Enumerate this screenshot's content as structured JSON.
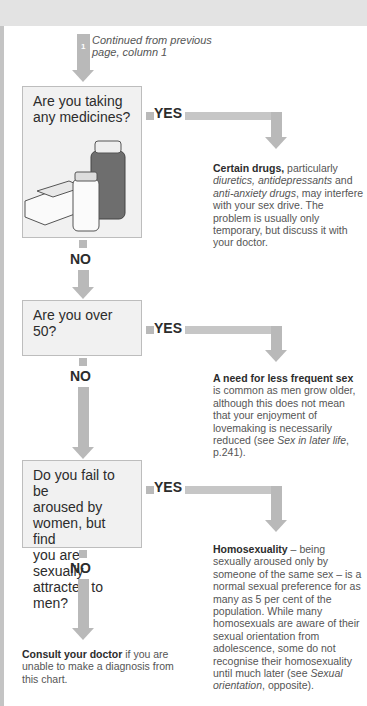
{
  "page": {
    "continued": {
      "badge": "1",
      "text_line1": "Continued from previous",
      "text_line2": "page, column 1"
    },
    "questions": [
      {
        "lines": [
          "Are you taking",
          "any medicines?"
        ],
        "yes_label": "YES",
        "no_label": "NO",
        "answer": {
          "bold": "Certain drugs,",
          "parts": [
            " particularly ",
            "diuretics, antidepressants",
            " and ",
            "anti-anxiety drugs",
            ", may interfere with your sex drive. The problem is usually only temporary, but discuss it with your doctor."
          ]
        },
        "illustration": "medicine-bottles-and-pill-blister-pack"
      },
      {
        "lines": [
          "Are you over 50?"
        ],
        "yes_label": "YES",
        "no_label": "NO",
        "answer": {
          "bold": "A need for less frequent sex",
          "parts": [
            " is common as men grow older, although this does not mean that your enjoyment of lovemaking is necessarily reduced (see ",
            "Sex in later life",
            ", p.241)."
          ]
        }
      },
      {
        "lines": [
          "Do you fail to be",
          "aroused by",
          "women, but find",
          "you are sexually",
          "attracted to men?"
        ],
        "yes_label": "YES",
        "no_label": "NO",
        "answer": {
          "bold": "Homosexuality",
          "parts": [
            " – being sexually aroused only by someone of the same sex – is a normal sexual preference for as many as 5 per cent of the population. While many homosexuals are aware of their sexual orientation from adolescence, some do not recognise their homosexuality until much later (see ",
            "Sexual orientation",
            ", opposite)."
          ]
        }
      }
    ],
    "final": {
      "bold": "Consult your doctor",
      "rest": " if you are unable to make a diagnosis from this chart."
    }
  }
}
